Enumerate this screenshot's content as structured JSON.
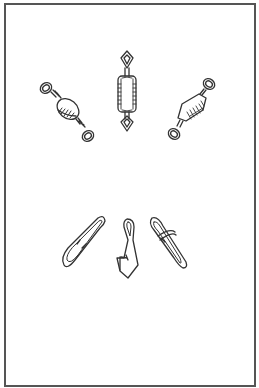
{
  "figure": {
    "colors": {
      "line": "#333333",
      "border": "#555555",
      "background": "#ffffff"
    },
    "swivels": [
      {
        "name": "barrel-swivel-left",
        "orientation": "tilted-left"
      },
      {
        "name": "barrel-swivel-center",
        "orientation": "vertical"
      },
      {
        "name": "barrel-swivel-right",
        "orientation": "tilted-right"
      }
    ],
    "snaps": [
      {
        "name": "hooked-snap"
      },
      {
        "name": "duolock-snap"
      },
      {
        "name": "coastlock-snap"
      }
    ]
  }
}
